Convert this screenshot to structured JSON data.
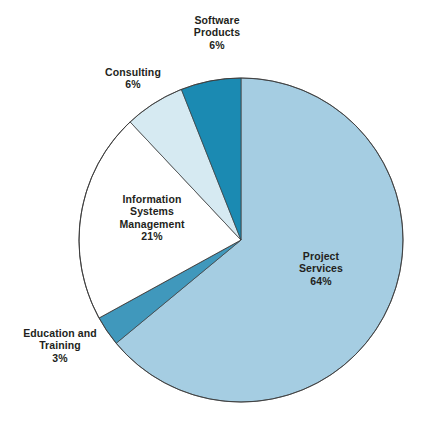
{
  "chart_data": {
    "type": "pie",
    "title": "",
    "subtitle": "",
    "xlabel": "",
    "ylabel": "",
    "legend_position": "none",
    "grid": false,
    "start_angle_deg": 0,
    "direction": "clockwise",
    "units": "percent",
    "categories": [
      "Project Services",
      "Education and Training",
      "Information Systems Management",
      "Consulting",
      "Software Products"
    ],
    "values": [
      64,
      3,
      21,
      6,
      6
    ],
    "slices": [
      {
        "id": "project-services",
        "label_lines": [
          "Project",
          "Services"
        ],
        "label_text": "Project Services",
        "percent_text": "64%",
        "value": 64,
        "color": "#a5cde2",
        "label_placement": "inside"
      },
      {
        "id": "education-training",
        "label_lines": [
          "Education and",
          "Training"
        ],
        "label_text": "Education and Training",
        "percent_text": "3%",
        "value": 3,
        "color": "#4098bc",
        "label_placement": "outside"
      },
      {
        "id": "information-systems-management",
        "label_lines": [
          "Information",
          "Systems",
          "Management"
        ],
        "label_text": "Information Systems Management",
        "percent_text": "21%",
        "value": 21,
        "color": "#ffffff",
        "label_placement": "inside"
      },
      {
        "id": "consulting",
        "label_lines": [
          "Consulting"
        ],
        "label_text": "Consulting",
        "percent_text": "6%",
        "value": 6,
        "color": "#d6eaf2",
        "label_placement": "outside"
      },
      {
        "id": "software-products",
        "label_lines": [
          "Software",
          "Products"
        ],
        "label_text": "Software Products",
        "percent_text": "6%",
        "value": 6,
        "color": "#1b8ab2",
        "label_placement": "outside"
      }
    ],
    "colors": {
      "project_services": "#a5cde2",
      "education_training": "#4098bc",
      "information_systems_management": "#ffffff",
      "consulting": "#d6eaf2",
      "software_products": "#1b8ab2",
      "outline": "#3b3b3b",
      "background": "#ffffff",
      "text": "#231f20"
    }
  }
}
